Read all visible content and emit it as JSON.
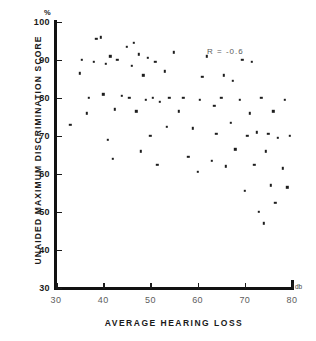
{
  "chart_data": {
    "type": "scatter",
    "title": "",
    "xlabel": "AVERAGE HEARING LOSS",
    "ylabel": "UNAIDED MAXIMUM DISCRIMINATION SCORE",
    "x_unit": "db",
    "y_unit": "%",
    "xlim": [
      30,
      80
    ],
    "ylim": [
      30,
      100
    ],
    "xticks": [
      30,
      40,
      50,
      60,
      70,
      80
    ],
    "yticks": [
      30,
      40,
      50,
      60,
      70,
      80,
      90,
      100
    ],
    "grid": false,
    "legend": "none",
    "annotations": [
      {
        "text": "R = -0.6",
        "x": 62,
        "y": 92
      }
    ],
    "points": [
      {
        "x": 33.0,
        "y": 73.0
      },
      {
        "x": 35.0,
        "y": 86.5
      },
      {
        "x": 35.5,
        "y": 90.0
      },
      {
        "x": 36.5,
        "y": 76.0
      },
      {
        "x": 37.0,
        "y": 80.0
      },
      {
        "x": 38.0,
        "y": 89.5
      },
      {
        "x": 38.5,
        "y": 95.5
      },
      {
        "x": 39.5,
        "y": 96.0
      },
      {
        "x": 40.0,
        "y": 81.0
      },
      {
        "x": 40.5,
        "y": 89.0
      },
      {
        "x": 41.0,
        "y": 69.0
      },
      {
        "x": 41.5,
        "y": 91.0
      },
      {
        "x": 42.0,
        "y": 64.0
      },
      {
        "x": 42.5,
        "y": 77.0
      },
      {
        "x": 43.0,
        "y": 90.0
      },
      {
        "x": 44.0,
        "y": 80.5
      },
      {
        "x": 45.0,
        "y": 93.5
      },
      {
        "x": 45.5,
        "y": 80.0
      },
      {
        "x": 46.0,
        "y": 88.5
      },
      {
        "x": 46.5,
        "y": 94.5
      },
      {
        "x": 47.0,
        "y": 76.5
      },
      {
        "x": 47.5,
        "y": 91.5
      },
      {
        "x": 48.0,
        "y": 66.0
      },
      {
        "x": 48.5,
        "y": 86.0
      },
      {
        "x": 49.0,
        "y": 79.5
      },
      {
        "x": 49.5,
        "y": 90.5
      },
      {
        "x": 50.0,
        "y": 70.0
      },
      {
        "x": 50.5,
        "y": 80.0
      },
      {
        "x": 51.0,
        "y": 89.5
      },
      {
        "x": 51.5,
        "y": 62.5
      },
      {
        "x": 52.0,
        "y": 79.0
      },
      {
        "x": 53.0,
        "y": 87.0
      },
      {
        "x": 53.5,
        "y": 72.5
      },
      {
        "x": 54.0,
        "y": 80.0
      },
      {
        "x": 55.0,
        "y": 92.0
      },
      {
        "x": 56.0,
        "y": 76.5
      },
      {
        "x": 57.0,
        "y": 80.0
      },
      {
        "x": 58.0,
        "y": 64.5
      },
      {
        "x": 59.0,
        "y": 72.0
      },
      {
        "x": 60.0,
        "y": 60.5
      },
      {
        "x": 60.5,
        "y": 79.5
      },
      {
        "x": 61.0,
        "y": 85.5
      },
      {
        "x": 62.0,
        "y": 91.0
      },
      {
        "x": 63.0,
        "y": 63.5
      },
      {
        "x": 63.5,
        "y": 78.0
      },
      {
        "x": 64.0,
        "y": 70.5
      },
      {
        "x": 65.0,
        "y": 80.0
      },
      {
        "x": 65.5,
        "y": 86.0
      },
      {
        "x": 66.0,
        "y": 62.0
      },
      {
        "x": 67.0,
        "y": 73.5
      },
      {
        "x": 67.5,
        "y": 84.5
      },
      {
        "x": 68.0,
        "y": 66.5
      },
      {
        "x": 69.0,
        "y": 79.5
      },
      {
        "x": 69.5,
        "y": 90.0
      },
      {
        "x": 70.0,
        "y": 55.5
      },
      {
        "x": 70.5,
        "y": 70.0
      },
      {
        "x": 71.0,
        "y": 76.0
      },
      {
        "x": 71.5,
        "y": 89.5
      },
      {
        "x": 72.0,
        "y": 62.5
      },
      {
        "x": 72.5,
        "y": 71.0
      },
      {
        "x": 73.0,
        "y": 50.0
      },
      {
        "x": 73.5,
        "y": 80.0
      },
      {
        "x": 74.0,
        "y": 47.0
      },
      {
        "x": 74.5,
        "y": 66.0
      },
      {
        "x": 75.0,
        "y": 70.5
      },
      {
        "x": 75.5,
        "y": 57.0
      },
      {
        "x": 76.0,
        "y": 76.5
      },
      {
        "x": 76.5,
        "y": 52.5
      },
      {
        "x": 77.0,
        "y": 69.5
      },
      {
        "x": 78.0,
        "y": 61.5
      },
      {
        "x": 78.5,
        "y": 79.5
      },
      {
        "x": 79.0,
        "y": 56.5
      },
      {
        "x": 79.5,
        "y": 70.0
      }
    ]
  }
}
